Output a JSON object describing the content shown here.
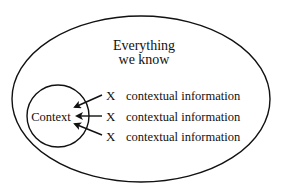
{
  "diagram": {
    "outer": {
      "label_line1": "Everything",
      "label_line2": "we know"
    },
    "inner": {
      "label": "Context"
    },
    "items": [
      {
        "marker": "X",
        "label": "contextual information"
      },
      {
        "marker": "X",
        "label": "contextual information"
      },
      {
        "marker": "X",
        "label": "contextual information"
      }
    ],
    "colors": {
      "stroke": "#111111",
      "background": "#ffffff"
    }
  }
}
